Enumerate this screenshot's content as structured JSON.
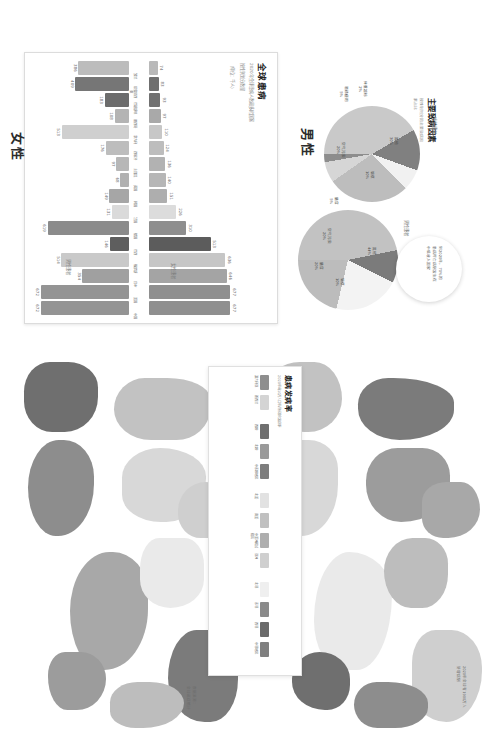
{
  "poster": {
    "orientation": "rotated-90",
    "background": "#ffffff"
  },
  "bar_panel": {
    "title": "全球患病",
    "subtitle_line1": "2020年全球患病人数最多的国家",
    "subtitle_line2": "按性别划分数量",
    "unit_note": "（单位：千人）",
    "axis_top_label": "女性患者",
    "axis_bottom_label": "男性患者"
  },
  "pie_panel": {
    "title": "主要致病因素",
    "subtitle": "按性别划分的主要致病因素占比",
    "pie_a_caption": "女性患者",
    "pie_b_caption": "男性患者",
    "callout_line1": "到2020年，70%的",
    "callout_line2": "患病死亡病例发生在",
    "callout_line3": "中低收入国家"
  },
  "map_panel": {
    "female_title": "女性",
    "male_title": "男性",
    "note_bottom_right_line1": "2020年全球有1900万人",
    "note_bottom_right_line2": "新增病例",
    "note_bottom_left_line1": "数据来源：",
    "note_bottom_left_line2": "全球癌症统计"
  },
  "legend_panel": {
    "title": "患病发病率",
    "subtitle": "2020年每10万人口年龄标准化发病率"
  },
  "chart_data": [
    {
      "type": "bar",
      "title": "全球患病",
      "subtitle": "2020年全球患病人数最多的国家（单位：千人）",
      "xlabel": "",
      "ylabel": "患病人数",
      "grid": false,
      "legend": "none",
      "categories": [
        "波兰",
        "印度尼西亚",
        "巴基斯坦",
        "墨西哥",
        "意大利",
        "西班牙",
        "土耳其",
        "英国",
        "韩国",
        "法国",
        "德国",
        "巴西",
        "俄罗斯",
        "日本",
        "美国",
        "中国"
      ],
      "series": [
        {
          "name": "女性患者",
          "ylim": [
            0,
            700
          ],
          "values": [
            74,
            83,
            93,
            97,
            110,
            124,
            136,
            140,
            151,
            226,
            310,
            513,
            636,
            646,
            677,
            677
          ],
          "colors": [
            "#b9b9b9",
            "#6f6f6f",
            "#717171",
            "#a9a9a9",
            "#c7c7c7",
            "#bdbdbd",
            "#b2b2b2",
            "#b6b6b6",
            "#aeaeae",
            "#dcdcdc",
            "#8e8e8e",
            "#5c5c5c",
            "#c6c6c6",
            "#a4a4a4",
            "#8f8f8f",
            "#8f8f8f"
          ]
        },
        {
          "name": "男性患者",
          "ylim": [
            0,
            700
          ],
          "values": [
            386,
            409,
            183,
            108,
            513,
            176,
            97,
            68,
            149,
            131,
            619,
            146,
            514,
            354,
            672,
            672
          ],
          "colors": [
            "#bcbcbc",
            "#767676",
            "#6c6c6c",
            "#b4b4b4",
            "#cfcfcf",
            "#bdbdbd",
            "#b7b7b7",
            "#b1b1b1",
            "#a6a6a6",
            "#dadada",
            "#8b8b8b",
            "#5e5e5e",
            "#c9c9c9",
            "#a0a0a0",
            "#949494",
            "#949494"
          ]
        }
      ]
    },
    {
      "type": "pie",
      "name": "女性患者致病因素",
      "title": "主要致病因素",
      "subtitle": "按性别划分的主要致病因素占比",
      "legend": "labels-on-slices",
      "slices": [
        {
          "label": "其他",
          "value": 30,
          "display": "30%",
          "color": "#c9c9c9"
        },
        {
          "label": "烟草",
          "value": 10,
          "display": "10%",
          "color": "#808080"
        },
        {
          "label": "膳食",
          "value": 5,
          "display": "5%",
          "color": "#f1f1f1"
        },
        {
          "label": "空气污染",
          "value": 20,
          "display": "20%",
          "color": "#bdbdbd"
        },
        {
          "label": "酒精使用",
          "value": 5,
          "display": "5%",
          "color": "#d6d6d6"
        },
        {
          "label": "体重超标",
          "value": 2,
          "display": "2%",
          "color": "#8d8d8d"
        }
      ]
    },
    {
      "type": "pie",
      "name": "男性患者致病因素",
      "title": "主要致病因素",
      "legend": "labels-on-slices",
      "slices": [
        {
          "label": "其他",
          "value": 44,
          "display": "44%",
          "color": "#c2c2c2"
        },
        {
          "label": "烟草",
          "value": 10,
          "display": "10%",
          "color": "#7b7b7b"
        },
        {
          "label": "膳食",
          "value": 20,
          "display": "20%",
          "color": "#f3f3f3"
        },
        {
          "label": "空气污染",
          "value": 20,
          "display": "20%",
          "color": "#bcbcbc"
        }
      ]
    },
    {
      "type": "heatmap",
      "name": "全球发病率地图",
      "title": "患病发病率",
      "subtitle": "2020年每10万人口年龄标准化发病率",
      "maps": [
        {
          "name": "女性",
          "title": "女性"
        },
        {
          "name": "男性",
          "title": "男性"
        }
      ],
      "legend_groups": [
        {
          "name": "最高组",
          "items": [
            {
              "label": "澳大利亚",
              "color": "#8e8e8e"
            },
            {
              "label": "新西兰",
              "color": "#d4d4d4"
            }
          ]
        },
        {
          "name": "欧洲组",
          "items": [
            {
              "label": "西欧",
              "color": "#6f6f6f"
            },
            {
              "label": "北欧",
              "color": "#9a9a9a"
            },
            {
              "label": "中东欧地区",
              "color": "#7d7d7d"
            }
          ]
        },
        {
          "name": "美洲组",
          "items": [
            {
              "label": "北美",
              "color": "#e2e2e2"
            },
            {
              "label": "南美",
              "color": "#c0c0c0"
            },
            {
              "label": "中美洲和加勒比",
              "color": "#aeaeae"
            },
            {
              "label": "亚洲",
              "color": "#cfcfcf"
            }
          ]
        },
        {
          "name": "非洲组",
          "items": [
            {
              "label": "北非",
              "color": "#efefef"
            },
            {
              "label": "东非",
              "color": "#8a8a8a"
            },
            {
              "label": "西非",
              "color": "#6a6a6a"
            },
            {
              "label": "中非地区",
              "color": "#7f7f7f"
            }
          ]
        }
      ]
    }
  ]
}
